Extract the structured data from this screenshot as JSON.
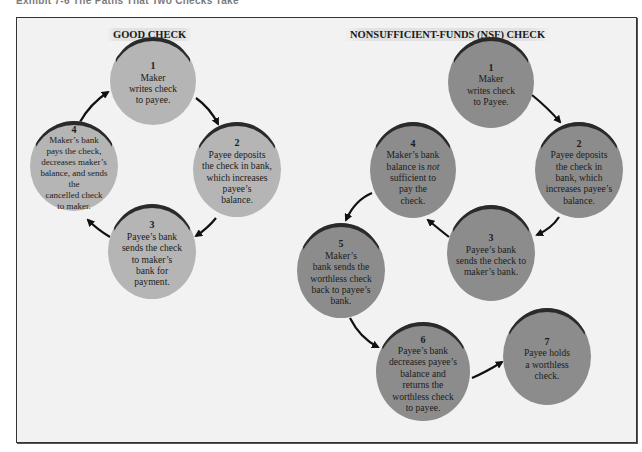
{
  "caption": "Exhibit 7-6   The Paths That Two Checks Take",
  "good_check": {
    "title": "GOOD CHECK",
    "steps": [
      {
        "num": "1",
        "text": "Maker\nwrites check\nto payee."
      },
      {
        "num": "2",
        "text": "Payee deposits\nthe check in bank,\nwhich increases\npayee’s\nbalance."
      },
      {
        "num": "3",
        "text": "Payee’s bank\nsends the check\nto maker’s\nbank for\npayment."
      },
      {
        "num": "4",
        "text": "Maker’s bank\npays the check,\ndecreases maker’s\nbalance, and sends the\ncancelled check\nto maker."
      }
    ]
  },
  "nsf_check": {
    "title": "NONSUFFICIENT-FUNDS (NSF) CHECK",
    "steps": [
      {
        "num": "1",
        "text": "Maker\nwrites check\nto Payee."
      },
      {
        "num": "2",
        "text": "Payee deposits\nthe check in\nbank, which\nincreases payee’s\nbalance."
      },
      {
        "num": "3",
        "text": "Payee’s bank\nsends the check to\nmaker’s bank."
      },
      {
        "num": "4",
        "text_pre": "Maker’s bank\nbalance is ",
        "text_em": "not",
        "text_post": "\nsufficient to\npay the\ncheck."
      },
      {
        "num": "5",
        "text": "Maker’s\nbank sends the\nworthless check\nback to payee’s\nbank."
      },
      {
        "num": "6",
        "text": "Payee’s bank\ndecreases payee’s\nbalance and\nreturns the\nworthless check\nto payee."
      },
      {
        "num": "7",
        "text": "Payee holds\na worthless\ncheck."
      }
    ]
  },
  "colors": {
    "good_node": "#b5b5b5",
    "nsf_node": "#8c8c8c",
    "frame_bg": "#f2f2f2",
    "arrow": "#111111"
  }
}
